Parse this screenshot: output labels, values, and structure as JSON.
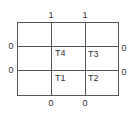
{
  "diagram": {
    "cells": {
      "top_left": "T4",
      "top_right": "T3",
      "bottom_left": "T1",
      "bottom_right": "T2"
    },
    "edge_labels": {
      "top": [
        "1",
        "1"
      ],
      "left": [
        "0",
        "0"
      ],
      "right": [
        "0",
        "0"
      ],
      "bottom": [
        "0",
        "0"
      ]
    },
    "colors": {
      "line": "#555555",
      "text": "#333333",
      "background": "#ffffff"
    }
  }
}
